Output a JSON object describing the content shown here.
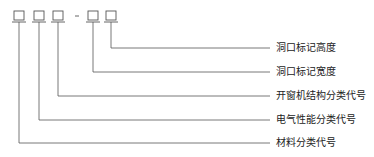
{
  "code_format": {
    "slots": [
      "box",
      "box",
      "box",
      "dash",
      "box",
      "box"
    ],
    "separator": "-"
  },
  "labels": [
    {
      "slot": 5,
      "text": "洞口标记高度"
    },
    {
      "slot": 4,
      "text": "洞口标记宽度"
    },
    {
      "slot": 2,
      "text": "开窗机结构分类代号"
    },
    {
      "slot": 1,
      "text": "电气性能分类代号"
    },
    {
      "slot": 0,
      "text": "材料分类代号"
    }
  ],
  "colors": {
    "line": "#555555",
    "text": "#222222"
  }
}
